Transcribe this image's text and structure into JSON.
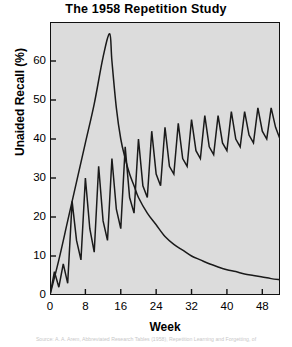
{
  "chart_data": {
    "type": "line",
    "title": "The 1958 Repetition Study",
    "xlabel": "Week",
    "ylabel": "Unaided Recall (%)",
    "xlim": [
      0,
      52
    ],
    "ylim": [
      0,
      70
    ],
    "grid": false,
    "legend": "none",
    "plot_background": "#dcdcdc",
    "line_color": "#1a1a1a",
    "xticks": [
      "0",
      "8",
      "16",
      "24",
      "32",
      "40",
      "48"
    ],
    "xtick_values": [
      0,
      8,
      16,
      24,
      32,
      40,
      48
    ],
    "yticks": [
      "0",
      "10",
      "20",
      "30",
      "40",
      "50",
      "60"
    ],
    "ytick_values": [
      0,
      10,
      20,
      30,
      40,
      50,
      60
    ],
    "series": [
      {
        "name": "Single massed presentation",
        "note": "rises sharply to a 67% peak near week 13.5 then decays toward 3%",
        "x": [
          0,
          2,
          4,
          6,
          8,
          10,
          12,
          13.5,
          14,
          15,
          16,
          17,
          18,
          19,
          20,
          22,
          24,
          26,
          28,
          30,
          32,
          34,
          36,
          38,
          40,
          42,
          44,
          46,
          48,
          50,
          52
        ],
        "values": [
          0,
          9,
          19,
          29,
          39,
          49,
          61,
          67,
          60,
          48,
          40,
          35,
          31,
          28,
          25,
          21,
          18,
          15,
          13,
          11.5,
          10,
          9,
          8,
          7.2,
          6.5,
          6,
          5.4,
          5,
          4.6,
          4.2,
          3.9
        ]
      },
      {
        "name": "Repeated (spaced) presentations",
        "note": "sawtooth: each repetition spikes recall, forgetting between spikes; baseline climbs and amplitude narrows",
        "x": [
          0,
          1,
          2,
          3,
          4,
          5,
          6,
          7,
          8,
          9,
          10,
          11,
          12,
          13,
          14,
          15,
          16,
          17,
          18,
          19,
          20,
          21,
          22,
          23,
          24,
          25,
          26,
          27,
          28,
          29,
          30,
          31,
          32,
          33,
          34,
          35,
          36,
          37,
          38,
          39,
          40,
          41,
          42,
          43,
          44,
          45,
          46,
          47,
          48,
          49,
          50,
          51,
          52
        ],
        "values": [
          0,
          6,
          2,
          8,
          3,
          24,
          14,
          9,
          30,
          17,
          11,
          33,
          19,
          14,
          35,
          22,
          17,
          38,
          25,
          21,
          40,
          28,
          25,
          42,
          31,
          28,
          43,
          33,
          31,
          44,
          35,
          33,
          45,
          37,
          35,
          46,
          38,
          36,
          46,
          39,
          37,
          47,
          40,
          38,
          47,
          41,
          39,
          48,
          42,
          40,
          48,
          43,
          40
        ]
      }
    ]
  },
  "caption": {
    "text": "Source: A. A. Arem, Abbreviated Research Tables (1958), Repetition Learning and Forgetting, of"
  }
}
